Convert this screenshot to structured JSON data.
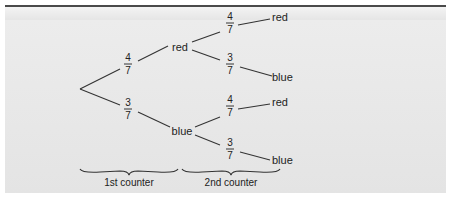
{
  "diagram": {
    "type": "probability-tree",
    "first_level": [
      {
        "label": "red",
        "probability": {
          "num": "4",
          "den": "7"
        }
      },
      {
        "label": "blue",
        "probability": {
          "num": "3",
          "den": "7"
        }
      }
    ],
    "second_level": [
      {
        "parent": "red",
        "label": "red",
        "probability": {
          "num": "4",
          "den": "7"
        }
      },
      {
        "parent": "red",
        "label": "blue",
        "probability": {
          "num": "3",
          "den": "7"
        }
      },
      {
        "parent": "blue",
        "label": "red",
        "probability": {
          "num": "4",
          "den": "7"
        }
      },
      {
        "parent": "blue",
        "label": "blue",
        "probability": {
          "num": "3",
          "den": "7"
        }
      }
    ],
    "brace_labels": [
      "1st counter",
      "2nd counter"
    ]
  },
  "colors": {
    "panel": "#e8e8e8",
    "line": "#333333",
    "topline": "#4a4a4a"
  }
}
